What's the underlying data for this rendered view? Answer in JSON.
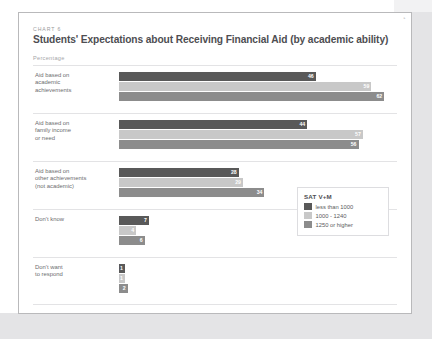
{
  "header": {
    "eyebrow": "CHART 6",
    "title": "Students' Expectations about Receiving Financial Aid (by academic ability)",
    "units": "Percentage"
  },
  "colors": {
    "series1": "#595959",
    "series2": "#c8c8c8",
    "series3": "#8c8c8c",
    "card_border": "#b9b9bb",
    "page_margin": "#e4e4e6",
    "gridline": "#e3e3e5"
  },
  "legend": {
    "title": "SAT V+M",
    "items": [
      {
        "label": "less than 1000",
        "color": "#595959"
      },
      {
        "label": "1000 - 1240",
        "color": "#c8c8c8"
      },
      {
        "label": "1250 or higher",
        "color": "#8c8c8c"
      }
    ]
  },
  "chart_data": {
    "type": "bar",
    "orientation": "horizontal",
    "title": "Students' Expectations about Receiving Financial Aid (by academic ability)",
    "subtitle": "CHART 6",
    "xlabel": "Percentage",
    "ylabel": "",
    "xlim": [
      0,
      65
    ],
    "grid": true,
    "legend_position": "bottom-right",
    "categories": [
      "Aid based on academic achievements",
      "Aid based on family income or need",
      "Aid based on other achievements (not academic)",
      "Don't know",
      "Don't want to respond"
    ],
    "series": [
      {
        "name": "less than 1000",
        "color": "#595959",
        "values": [
          46,
          44,
          28,
          7,
          1
        ]
      },
      {
        "name": "1000 - 1240",
        "color": "#c8c8c8",
        "values": [
          59,
          57,
          29,
          4,
          1
        ]
      },
      {
        "name": "1250 or higher",
        "color": "#8c8c8c",
        "values": [
          62,
          56,
          34,
          6,
          2
        ]
      }
    ]
  },
  "groups": [
    {
      "label_lines": [
        "Aid based on",
        "academic",
        "achievements"
      ],
      "values": [
        46,
        59,
        62
      ]
    },
    {
      "label_lines": [
        "Aid based on",
        "family income",
        "or need"
      ],
      "values": [
        44,
        57,
        56
      ]
    },
    {
      "label_lines": [
        "Aid based on",
        "other achievements",
        "(not academic)"
      ],
      "values": [
        28,
        29,
        34
      ]
    },
    {
      "label_lines": [
        "Don't know"
      ],
      "values": [
        7,
        4,
        6
      ]
    },
    {
      "label_lines": [
        "Don't want",
        "to respond"
      ],
      "values": [
        1,
        1,
        2
      ]
    }
  ]
}
